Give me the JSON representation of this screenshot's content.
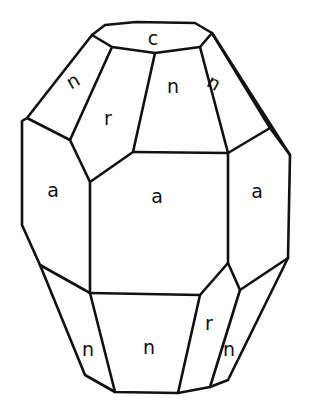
{
  "diagram": {
    "face_labels": [
      {
        "id": "c-top",
        "text": "c",
        "x": 153,
        "y": 38
      },
      {
        "id": "n-upper-left",
        "text": "n",
        "x": 73,
        "y": 81,
        "rotate": -30
      },
      {
        "id": "r-upper",
        "text": "r",
        "x": 108,
        "y": 118
      },
      {
        "id": "n-upper-center",
        "text": "n",
        "x": 173,
        "y": 86
      },
      {
        "id": "n-upper-right",
        "text": "n",
        "x": 214,
        "y": 83,
        "rotate": 30
      },
      {
        "id": "a-left",
        "text": "a",
        "x": 53,
        "y": 190
      },
      {
        "id": "a-center",
        "text": "a",
        "x": 157,
        "y": 196
      },
      {
        "id": "a-right",
        "text": "a",
        "x": 257,
        "y": 191
      },
      {
        "id": "n-lower-left",
        "text": "n",
        "x": 88,
        "y": 349
      },
      {
        "id": "n-lower-center",
        "text": "n",
        "x": 149,
        "y": 347
      },
      {
        "id": "r-lower",
        "text": "r",
        "x": 209,
        "y": 323
      },
      {
        "id": "n-lower-right",
        "text": "n",
        "x": 229,
        "y": 349
      }
    ],
    "edges": [
      "M92,35 L105,25 L136,22 L195,23 L212,33 L200,47 L155,53 L112,47 Z",
      "M92,35 L27,118 L22,121 L22,225 L40,265 L85,375 L115,392 L178,393 L210,387 L228,380 L288,258 L290,155 L212,33",
      "M212,33 L270,128",
      "M112,47 L70,140 L27,118",
      "M70,140 L90,182 L133,152 L155,53",
      "M200,47 L228,153 L270,128 L290,155",
      "M133,152 L228,153",
      "M90,182 L90,293 L40,265",
      "M90,293 L200,295 L228,263 L228,153",
      "M228,263 L240,290 L288,258",
      "M90,293 L115,392",
      "M200,295 L178,393",
      "M240,290 L210,387"
    ]
  }
}
